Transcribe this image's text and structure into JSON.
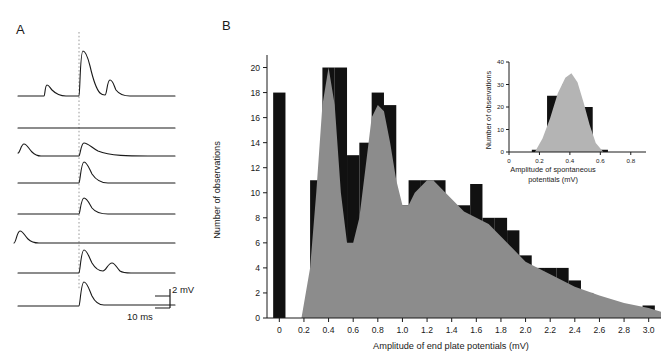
{
  "figure": {
    "panel_a_label": "A",
    "panel_b_label": "B"
  },
  "panel_a": {
    "scale_vertical": "2 mV",
    "scale_horizontal": "10 ms",
    "trace_count": 8,
    "stimulus_marker": "dotted-vertical-line"
  },
  "panel_b": {
    "xlabel": "Amplitude of end plate potentials (mV)",
    "ylabel": "Number of observations",
    "xticks": [
      "0",
      "0.2",
      "0.4",
      "0.6",
      "0.8",
      "1.0",
      "1.2",
      "1.4",
      "1.6",
      "1.8",
      "2.0",
      "2.2",
      "2.4",
      "2.6",
      "2.8",
      "3.0"
    ],
    "yticks": [
      "0",
      "2",
      "4",
      "6",
      "8",
      "10",
      "12",
      "14",
      "16",
      "18",
      "20"
    ]
  },
  "inset": {
    "xlabel_line1": "Amplitude of spontaneous",
    "xlabel_line2": "potentials (mV)",
    "ylabel": "Number of observations",
    "xticks": [
      "0",
      "0.2",
      "0.4",
      "0.6",
      "0.8"
    ],
    "yticks": [
      "0",
      "10",
      "20",
      "30",
      "40"
    ]
  },
  "colors": {
    "bar": "#111111",
    "curve": "#8c8c8c",
    "curve_light": "#b4b4b4",
    "axis": "#1a1a1a",
    "dashed_line": "#9a9a9a"
  },
  "chart_data": [
    {
      "type": "bar",
      "name": "end-plate-potential-histogram",
      "title": "",
      "xlabel": "Amplitude of end plate potentials (mV)",
      "ylabel": "Number of observations",
      "xlim": [
        -0.1,
        3.1
      ],
      "ylim": [
        0,
        21
      ],
      "xtick_values": [
        0,
        0.2,
        0.4,
        0.6,
        0.8,
        1.0,
        1.2,
        1.4,
        1.6,
        1.8,
        2.0,
        2.2,
        2.4,
        2.6,
        2.8,
        3.0
      ],
      "ytick_values": [
        0,
        2,
        4,
        6,
        8,
        10,
        12,
        14,
        16,
        18,
        20
      ],
      "grid": false,
      "legend": "none",
      "bin_width": 0.1,
      "bin_left_edges": [
        -0.05,
        0.25,
        0.35,
        0.45,
        0.55,
        0.65,
        0.75,
        0.85,
        0.95,
        1.05,
        1.15,
        1.25,
        1.35,
        1.45,
        1.55,
        1.65,
        1.75,
        1.85,
        1.95,
        2.05,
        2.15,
        2.25,
        2.35,
        2.45,
        2.55,
        2.65,
        2.75,
        2.85,
        2.95
      ],
      "values": [
        18,
        11,
        20,
        20,
        13,
        14,
        18,
        17,
        9,
        11,
        11,
        11,
        9,
        9,
        13,
        8,
        8,
        7,
        5,
        4,
        4,
        4,
        3,
        2,
        1,
        1,
        1,
        0,
        1
      ],
      "overlay_curve": {
        "name": "predicted-distribution",
        "type": "area",
        "color": "#8c8c8c",
        "x": [
          0.18,
          0.25,
          0.3,
          0.35,
          0.4,
          0.45,
          0.5,
          0.55,
          0.6,
          0.65,
          0.7,
          0.75,
          0.8,
          0.85,
          0.9,
          0.95,
          1.0,
          1.05,
          1.1,
          1.15,
          1.2,
          1.25,
          1.3,
          1.35,
          1.4,
          1.5,
          1.6,
          1.7,
          1.8,
          1.9,
          2.0,
          2.1,
          2.2,
          2.4,
          2.6,
          2.8,
          3.0,
          3.1
        ],
        "y": [
          0,
          4,
          10,
          17,
          20,
          17,
          10,
          6,
          6,
          8,
          12,
          16,
          17,
          16.5,
          14,
          11,
          9,
          9,
          10,
          10.5,
          11,
          11,
          10.5,
          10,
          9.5,
          8.5,
          8,
          7.5,
          6.5,
          5.5,
          4.5,
          4,
          3.5,
          2.5,
          1.8,
          1.2,
          0.8,
          0.5
        ]
      }
    },
    {
      "type": "bar",
      "name": "spontaneous-potential-inset-histogram",
      "title": "",
      "xlabel": "Amplitude of spontaneous potentials (mV)",
      "ylabel": "Number of observations",
      "xlim": [
        0,
        0.9
      ],
      "ylim": [
        0,
        40
      ],
      "xtick_values": [
        0,
        0.2,
        0.4,
        0.6,
        0.8
      ],
      "ytick_values": [
        0,
        10,
        20,
        30,
        40
      ],
      "grid": false,
      "legend": "none",
      "bin_width": 0.1,
      "bin_left_edges": [
        0.15,
        0.25,
        0.35,
        0.45,
        0.55
      ],
      "values": [
        1,
        25,
        30,
        20,
        1
      ],
      "overlay_curve": {
        "name": "gaussian-fit",
        "type": "area",
        "color": "#b4b4b4",
        "x": [
          0.17,
          0.22,
          0.27,
          0.32,
          0.37,
          0.41,
          0.45,
          0.49,
          0.53,
          0.57,
          0.62
        ],
        "y": [
          0,
          6,
          15,
          26,
          33,
          35,
          31,
          22,
          12,
          4,
          0
        ]
      }
    }
  ]
}
